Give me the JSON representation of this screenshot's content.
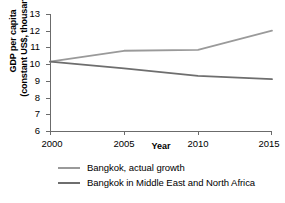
{
  "chart_data": {
    "type": "line",
    "title": "",
    "xlabel": "Year",
    "ylabel": "GDP per capita (constant US$, thousands)",
    "ylabel_line1": "GDP per capita",
    "ylabel_line2": "(constant US$, thousands)",
    "x": [
      2000,
      2005,
      2010,
      2015
    ],
    "xlim": [
      2000,
      2015
    ],
    "ylim": [
      6,
      13
    ],
    "xticks": [
      2000,
      2005,
      2010,
      2015
    ],
    "xtick_labels": [
      "2000",
      "2005",
      "2010",
      "2015"
    ],
    "yticks": [
      6,
      7,
      8,
      9,
      10,
      11,
      12,
      13
    ],
    "ytick_labels": [
      "6",
      "7",
      "8",
      "9",
      "10",
      "11",
      "12",
      "13"
    ],
    "grid": false,
    "legend_position": "below",
    "series": [
      {
        "name": "Bangkok, actual growth",
        "color": "#9a9a9a",
        "values": [
          10.15,
          10.8,
          10.85,
          12.0
        ]
      },
      {
        "name": "Bangkok in Middle East and North Africa",
        "color": "#6e6e6e",
        "values": [
          10.15,
          9.75,
          9.3,
          9.1
        ]
      }
    ]
  },
  "legend": {
    "items": [
      {
        "label": "Bangkok, actual growth",
        "color": "#9a9a9a"
      },
      {
        "label": "Bangkok in Middle East and North Africa",
        "color": "#6e6e6e"
      }
    ]
  },
  "colors": {
    "axis": "#6b6b6b",
    "text": "#000000",
    "background": "#ffffff",
    "series_light": "#9a9a9a",
    "series_dark": "#6e6e6e"
  }
}
